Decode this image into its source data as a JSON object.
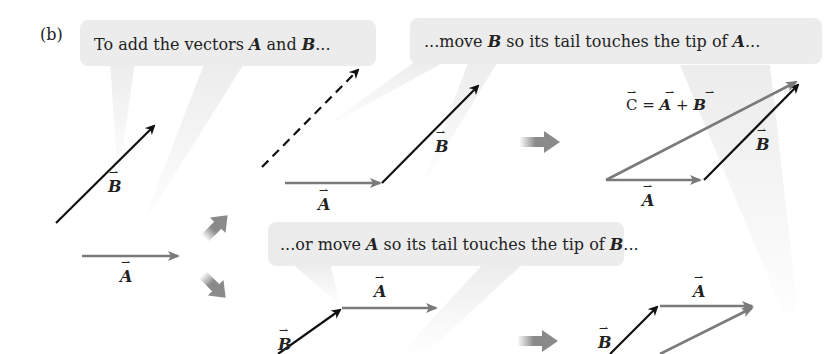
{
  "figure": {
    "panel_label": "(b)",
    "colors": {
      "vector_A": "#7a7a7a",
      "vector_B": "#111111",
      "vector_C": "#7a7a7a",
      "callout_bg": "#ececec",
      "step_arrow": "#8a8a8a"
    },
    "callouts": [
      {
        "id": "c1",
        "pre": "To add the vectors ",
        "v1": "A",
        "mid": " and ",
        "v2": "B",
        "post": "..."
      },
      {
        "id": "c2",
        "pre": "...move ",
        "v1": "B",
        "mid": " so its tail touches the tip of ",
        "v2": "A",
        "post": "..."
      },
      {
        "id": "c3",
        "pre": "...or move ",
        "v1": "A",
        "mid": " so its tail touches the tip of ",
        "v2": "B",
        "post": "..."
      }
    ],
    "labels": {
      "A": "A",
      "B": "B",
      "C": "C",
      "equation_eq": " = ",
      "equation_plus": " + "
    }
  }
}
